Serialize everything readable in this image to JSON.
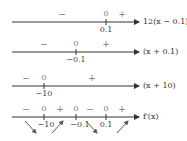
{
  "diagram": {
    "type": "sign-chart",
    "rows": [
      {
        "function_label": "12(x − 0.1)",
        "critical_points": [
          {
            "label": "0.1",
            "x": 106
          }
        ],
        "signs": [
          {
            "text": "−",
            "x": 62
          },
          {
            "text": "0",
            "x": 106
          },
          {
            "text": "+",
            "x": 122
          }
        ]
      },
      {
        "function_label": "(x + 0.1)",
        "critical_points": [
          {
            "label": "−0.1",
            "x": 76
          }
        ],
        "signs": [
          {
            "text": "−",
            "x": 44
          },
          {
            "text": "0",
            "x": 76
          },
          {
            "text": "+",
            "x": 106
          }
        ]
      },
      {
        "function_label": "(x + 10)",
        "critical_points": [
          {
            "label": "−10",
            "x": 44
          }
        ],
        "signs": [
          {
            "text": "−",
            "x": 26
          },
          {
            "text": "0",
            "x": 44
          },
          {
            "text": "+",
            "x": 92
          }
        ]
      },
      {
        "function_label": "f′(x)",
        "critical_points": [
          {
            "label": "−10",
            "x": 44
          },
          {
            "label": "−0.1",
            "x": 76
          },
          {
            "label": "0.1",
            "x": 106
          }
        ],
        "signs": [
          {
            "text": "−",
            "x": 26
          },
          {
            "text": "0",
            "x": 44
          },
          {
            "text": "+",
            "x": 60
          },
          {
            "text": "0",
            "x": 76
          },
          {
            "text": "−",
            "x": 90
          },
          {
            "text": "0",
            "x": 106
          },
          {
            "text": "+",
            "x": 122
          }
        ],
        "behavior": [
          "decreasing",
          "increasing",
          "decreasing",
          "increasing"
        ]
      }
    ]
  }
}
